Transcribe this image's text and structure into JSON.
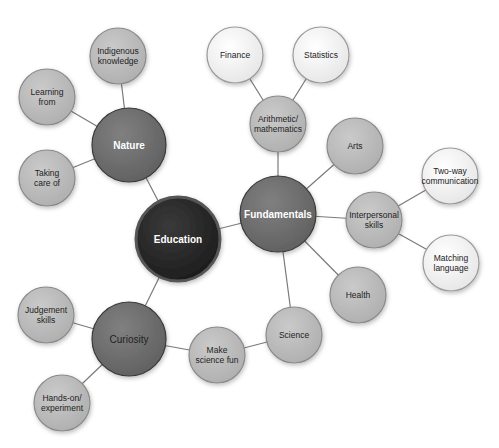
{
  "colors": {
    "background": "#ffffff",
    "edge": "#7a7a7a",
    "root_fill": "#2b2b2b",
    "hub_fill": "#6f6f6f",
    "leaf_fill": "#bcbcbc",
    "outer_fill": "#f1f1f1",
    "dark_text": "#ffffff",
    "light_text": "#222222"
  },
  "nodes": [
    {
      "id": "education",
      "lines": [
        "Education"
      ],
      "x": 178,
      "y": 239,
      "r": 42,
      "level": "root"
    },
    {
      "id": "nature",
      "lines": [
        "Nature"
      ],
      "x": 129,
      "y": 145,
      "r": 37,
      "level": "hub"
    },
    {
      "id": "fundamentals",
      "lines": [
        "Fundamentals"
      ],
      "x": 278,
      "y": 214,
      "r": 38,
      "level": "hub"
    },
    {
      "id": "curiosity",
      "lines": [
        "Curiosity"
      ],
      "x": 129,
      "y": 339,
      "r": 37,
      "level": "hub-dark-text"
    },
    {
      "id": "indigenous-knowledge",
      "lines": [
        "Indigenous",
        "knowledge"
      ],
      "x": 118,
      "y": 56,
      "r": 28,
      "level": "leaf"
    },
    {
      "id": "learning-from",
      "lines": [
        "Learning",
        "from"
      ],
      "x": 47,
      "y": 97,
      "r": 28,
      "level": "leaf"
    },
    {
      "id": "taking-care-of",
      "lines": [
        "Taking",
        "care of"
      ],
      "x": 47,
      "y": 178,
      "r": 28,
      "level": "leaf"
    },
    {
      "id": "arithmetic-mathematics",
      "lines": [
        "Arithmetic/",
        "mathematics"
      ],
      "x": 278,
      "y": 124,
      "r": 28,
      "level": "leaf"
    },
    {
      "id": "finance",
      "lines": [
        "Finance"
      ],
      "x": 235,
      "y": 55,
      "r": 28,
      "level": "outer"
    },
    {
      "id": "statistics",
      "lines": [
        "Statistics"
      ],
      "x": 321,
      "y": 55,
      "r": 28,
      "level": "outer"
    },
    {
      "id": "arts",
      "lines": [
        "Arts"
      ],
      "x": 355,
      "y": 146,
      "r": 28,
      "level": "leaf"
    },
    {
      "id": "interpersonal-skills",
      "lines": [
        "Interpersonal",
        "skills"
      ],
      "x": 374,
      "y": 220,
      "r": 28,
      "level": "leaf"
    },
    {
      "id": "two-way-communication",
      "lines": [
        "Two-way",
        "communication"
      ],
      "x": 450,
      "y": 176,
      "r": 28,
      "level": "outer"
    },
    {
      "id": "matching-language",
      "lines": [
        "Matching",
        "language"
      ],
      "x": 451,
      "y": 263,
      "r": 28,
      "level": "outer"
    },
    {
      "id": "health",
      "lines": [
        "Health"
      ],
      "x": 358,
      "y": 295,
      "r": 28,
      "level": "leaf"
    },
    {
      "id": "science",
      "lines": [
        "Science"
      ],
      "x": 294,
      "y": 335,
      "r": 28,
      "level": "leaf"
    },
    {
      "id": "make-science-fun",
      "lines": [
        "Make",
        "science fun"
      ],
      "x": 217,
      "y": 355,
      "r": 28,
      "level": "leaf"
    },
    {
      "id": "judgement-skills",
      "lines": [
        "Judgement",
        "skills"
      ],
      "x": 46,
      "y": 315,
      "r": 28,
      "level": "leaf"
    },
    {
      "id": "hands-on-experiment",
      "lines": [
        "Hands-on/",
        "experiment"
      ],
      "x": 62,
      "y": 403,
      "r": 28,
      "level": "leaf"
    }
  ],
  "edges": [
    [
      "education",
      "nature"
    ],
    [
      "education",
      "fundamentals"
    ],
    [
      "education",
      "curiosity"
    ],
    [
      "nature",
      "indigenous-knowledge"
    ],
    [
      "nature",
      "learning-from"
    ],
    [
      "nature",
      "taking-care-of"
    ],
    [
      "fundamentals",
      "arithmetic-mathematics"
    ],
    [
      "arithmetic-mathematics",
      "finance"
    ],
    [
      "arithmetic-mathematics",
      "statistics"
    ],
    [
      "fundamentals",
      "arts"
    ],
    [
      "fundamentals",
      "interpersonal-skills"
    ],
    [
      "interpersonal-skills",
      "two-way-communication"
    ],
    [
      "interpersonal-skills",
      "matching-language"
    ],
    [
      "fundamentals",
      "health"
    ],
    [
      "fundamentals",
      "science"
    ],
    [
      "science",
      "make-science-fun"
    ],
    [
      "curiosity",
      "make-science-fun"
    ],
    [
      "curiosity",
      "judgement-skills"
    ],
    [
      "curiosity",
      "hands-on-experiment"
    ]
  ]
}
